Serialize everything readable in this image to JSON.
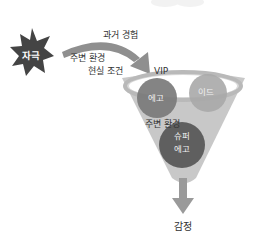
{
  "diagram": {
    "stimulus": {
      "label": "자극",
      "color": "#444444"
    },
    "inputs": [
      {
        "label": "과거 경험"
      },
      {
        "label": "주변 환경"
      },
      {
        "label": "현실 조건"
      }
    ],
    "funnel": {
      "top_label": "VIP",
      "color": "#c8c8c8",
      "rim_color": "#ffffff",
      "circles": [
        {
          "label": "에고",
          "color": "#7a7a7a"
        },
        {
          "label": "이드",
          "color": "#a9a9a9"
        },
        {
          "label_line1": "슈퍼",
          "label_line2": "에고",
          "color": "#5f5f5f"
        }
      ],
      "middle_label": "주변 환경"
    },
    "output": {
      "label": "감정",
      "arrow_color": "#9a9a9a"
    },
    "colors": {
      "arrow": "#8f8f8f",
      "text": "#333333"
    }
  }
}
